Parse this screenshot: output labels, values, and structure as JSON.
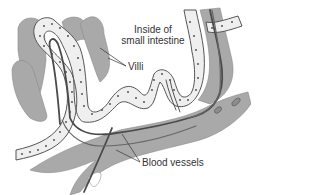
{
  "figure": {
    "labels": {
      "lumen_line1": "Inside of",
      "lumen_line2": "small intestine",
      "villi": "Villi",
      "blood_vessels": "Blood vessels"
    },
    "colors": {
      "background": "#ffffff",
      "tissue_gray": "#a9a9a9",
      "cell_fill": "#efefef",
      "outline": "#555555",
      "vessel_dark": "#4a4a4a",
      "text": "#333333"
    }
  }
}
